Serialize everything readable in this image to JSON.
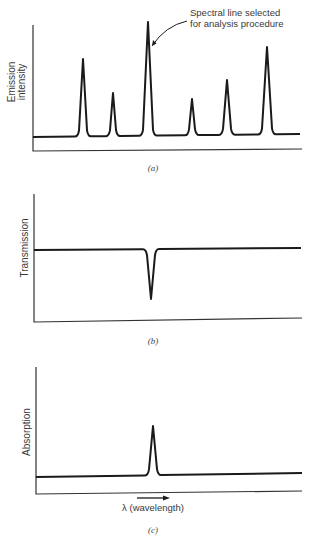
{
  "figure": {
    "background": "#ffffff",
    "ink_color": "#1a1a1a",
    "axis_color": "#333333"
  },
  "chart_data": [
    {
      "type": "line",
      "panel": "a",
      "caption": "(a)",
      "title": "",
      "xlabel": "",
      "ylabel_lines": [
        "Emission",
        "intensity"
      ],
      "ylabel": "Emission intensity",
      "grid": false,
      "baseline": 0.12,
      "peaks": [
        {
          "x": 0.19,
          "height": 0.61
        },
        {
          "x": 0.3,
          "height": 0.35
        },
        {
          "x": 0.43,
          "height": 0.91
        },
        {
          "x": 0.59,
          "height": 0.3
        },
        {
          "x": 0.72,
          "height": 0.45
        },
        {
          "x": 0.87,
          "height": 0.71
        }
      ],
      "annotation": {
        "lines": [
          "Spectral line selected",
          "for analysis procedure"
        ],
        "text": "Spectral line selected for analysis procedure",
        "points_to_peak_index": 2
      },
      "geom": {
        "axis_x": 33,
        "axis_top": 25,
        "axis_bottom": 151,
        "axis_right": 302,
        "axis_bottom_right": 149,
        "base_left_y": 137,
        "base_right_y": 134,
        "curve_right": 300,
        "peak_px": [
          [
            83,
            59,
            5
          ],
          [
            113,
            93,
            4
          ],
          [
            148,
            22,
            6
          ],
          [
            192,
            99,
            4
          ],
          [
            227,
            80,
            5
          ],
          [
            267,
            47,
            6
          ]
        ],
        "ylabel_x": [
          12,
          22
        ],
        "ylabel_y": 82,
        "annot_x": 190,
        "annot_y": [
          16,
          27
        ],
        "arrow": {
          "from": [
            187,
            21
          ],
          "ctrl": [
            165,
            26
          ],
          "to": [
            152,
            46
          ]
        },
        "caption_x": 153,
        "caption_y": 171
      }
    },
    {
      "type": "line",
      "panel": "b",
      "caption": "(b)",
      "title": "",
      "xlabel": "",
      "ylabel": "Transmission",
      "grid": false,
      "level": 0.56,
      "dips": [
        {
          "x": 0.44,
          "depth": 0.38
        }
      ],
      "geom": {
        "axis_x": 34,
        "axis_top": 194,
        "axis_bottom": 322,
        "axis_right": 302,
        "axis_bottom_right": 318,
        "base_left_y": 250,
        "base_right_y": 248,
        "curve_right": 301,
        "dip_px": [
          [
            151,
            299,
            5
          ]
        ],
        "ylabel_x": 25,
        "ylabel_y": 248,
        "caption_x": 153,
        "caption_y": 344
      }
    },
    {
      "type": "line",
      "panel": "c",
      "caption": "(c)",
      "title": "",
      "xlabel": "λ (wavelength)",
      "ylabel": "Absorption",
      "grid": false,
      "baseline": 0.14,
      "peaks": [
        {
          "x": 0.44,
          "height": 0.53
        }
      ],
      "geom": {
        "axis_x": 36,
        "axis_top": 367,
        "axis_bottom": 494,
        "axis_right": 302,
        "axis_bottom_right": 491,
        "base_left_y": 477,
        "base_right_y": 473,
        "curve_right": 302,
        "peak_px": [
          [
            153,
            426,
            5
          ]
        ],
        "ylabel_x": 27,
        "ylabel_y": 432,
        "xarrow": {
          "x1": 137,
          "x2": 170,
          "y": 498
        },
        "xlabel_x": 153,
        "xlabel_y": 511,
        "caption_x": 153,
        "caption_y": 533
      }
    }
  ]
}
